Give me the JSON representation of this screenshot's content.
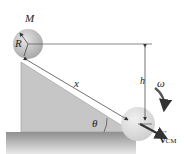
{
  "diagram": {
    "type": "rolling-ball-on-incline",
    "labels": {
      "mass": "M",
      "radius": "R",
      "distance": "x",
      "height": "h",
      "angle": "θ",
      "angular_velocity": "ω",
      "velocity": "v",
      "velocity_subscript": "CM",
      "velocity_arrow": "→"
    },
    "colors": {
      "incline": "#c8c8c8",
      "ground": "#9a9a9a",
      "ball": "#cfcfcf",
      "lines": "#333333",
      "arrow": "#333333"
    }
  }
}
